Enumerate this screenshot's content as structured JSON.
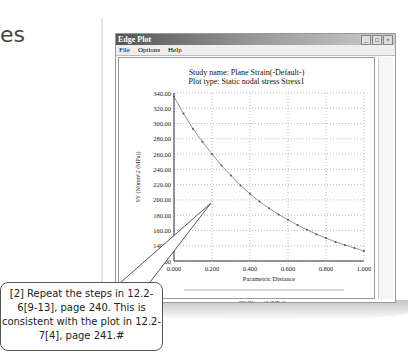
{
  "page": {
    "heading_fragment": "es"
  },
  "window": {
    "title": "Edge Plot",
    "controls": [
      "_",
      "□",
      "×"
    ],
    "menu": [
      "File",
      "Options",
      "Help"
    ]
  },
  "plot": {
    "study_line": "Study name: Plane Strain(-Default-)",
    "type_line": "Plot type: Static nodal stress Stress1",
    "legend": "SY (N/mm^2 (MPa))",
    "coords": "0, 0"
  },
  "callout": {
    "text": "[2] Repeat the steps in 12.2-6[9-13], page 240. This is consistent with the plot in 12.2-7[4], page 241.#"
  },
  "chart_data": {
    "type": "line",
    "xlabel": "Parametric Distance",
    "ylabel": "SY (N/mm^2 (MPa))",
    "xlim": [
      0,
      1
    ],
    "ylim": [
      120,
      340
    ],
    "xticks": [
      "0.000",
      "0.200",
      "0.400",
      "0.600",
      "0.800",
      "1.000"
    ],
    "yticks": [
      "120.00",
      "140.00",
      "160.00",
      "180.00",
      "200.00",
      "220.00",
      "240.00",
      "260.00",
      "280.00",
      "300.00",
      "320.00",
      "340.00"
    ],
    "grid": true,
    "legend_position": "bottom",
    "series": [
      {
        "name": "SY (N/mm^2 (MPa))",
        "x": [
          0,
          0.05,
          0.1,
          0.15,
          0.2,
          0.25,
          0.3,
          0.35,
          0.4,
          0.45,
          0.5,
          0.55,
          0.6,
          0.65,
          0.7,
          0.75,
          0.8,
          0.85,
          0.9,
          0.95,
          1.0
        ],
        "values": [
          335,
          313,
          293,
          276,
          260,
          245,
          232,
          219,
          208,
          198,
          189,
          181,
          174,
          167,
          161,
          155,
          150,
          145,
          141,
          137,
          133
        ]
      }
    ]
  }
}
